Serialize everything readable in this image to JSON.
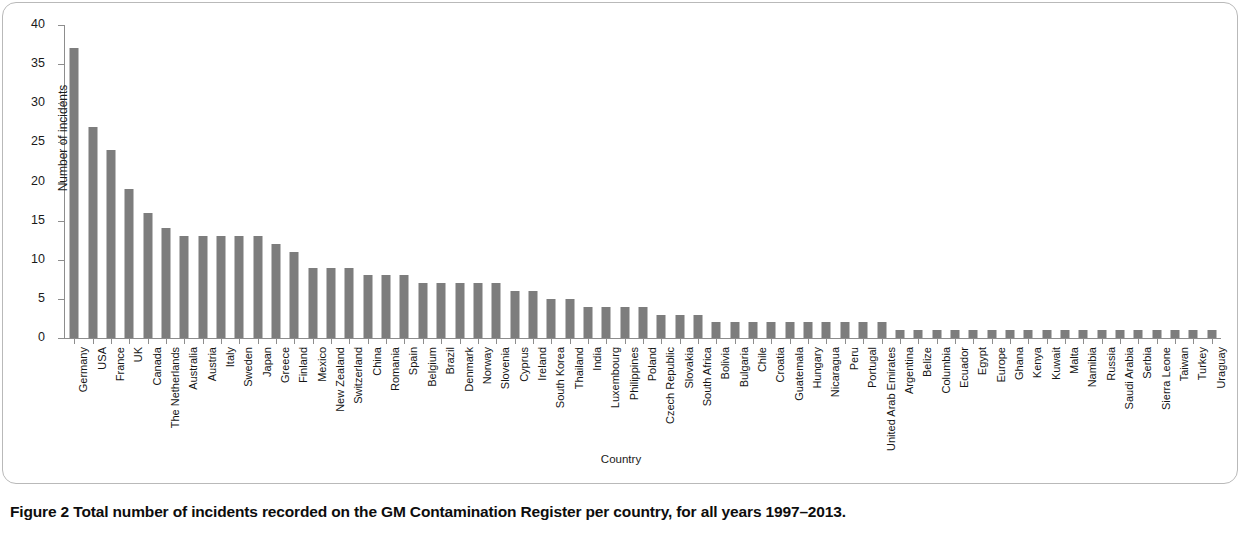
{
  "figure": {
    "label": "Figure 2",
    "caption": "Total number of incidents recorded on the GM Contamination Register per country, for all years 1997–2013."
  },
  "chart_data": {
    "type": "bar",
    "title": "",
    "xlabel": "Country",
    "ylabel": "Number of incidents",
    "ylim": [
      0,
      40
    ],
    "yticks": [
      0,
      5,
      10,
      15,
      20,
      25,
      30,
      35,
      40
    ],
    "grid": false,
    "legend": null,
    "bar_color": "#7d7d7d",
    "categories": [
      "Germany",
      "USA",
      "France",
      "UK",
      "Canada",
      "The Netherlands",
      "Australia",
      "Austria",
      "Italy",
      "Sweden",
      "Japan",
      "Greece",
      "Finland",
      "Mexico",
      "New Zealand",
      "Switzerland",
      "China",
      "Romania",
      "Spain",
      "Belgium",
      "Brazil",
      "Denmark",
      "Norway",
      "Slovenia",
      "Cyprus",
      "Ireland",
      "South Korea",
      "Thailand",
      "India",
      "Luxembourg",
      "Philippines",
      "Poland",
      "Czech Republic",
      "Slovakia",
      "South Africa",
      "Bolivia",
      "Bulgaria",
      "Chile",
      "Croatia",
      "Guatemala",
      "Hungary",
      "Nicaragua",
      "Peru",
      "Portugal",
      "United Arab Emirates",
      "Argentina",
      "Belize",
      "Columbia",
      "Ecuador",
      "Egypt",
      "Europe",
      "Ghana",
      "Kenya",
      "Kuwait",
      "Malta",
      "Namibia",
      "Russia",
      "Saudi Arabia",
      "Serbia",
      "Sierra Leone",
      "Taiwan",
      "Turkey",
      "Uraguay"
    ],
    "values": [
      37,
      27,
      24,
      19,
      16,
      14,
      13,
      13,
      13,
      13,
      13,
      12,
      11,
      9,
      9,
      9,
      8,
      8,
      8,
      7,
      7,
      7,
      7,
      7,
      6,
      6,
      5,
      5,
      4,
      4,
      4,
      4,
      3,
      3,
      3,
      2,
      2,
      2,
      2,
      2,
      2,
      2,
      2,
      2,
      2,
      1,
      1,
      1,
      1,
      1,
      1,
      1,
      1,
      1,
      1,
      1,
      1,
      1,
      1,
      1,
      1,
      1,
      1
    ]
  }
}
